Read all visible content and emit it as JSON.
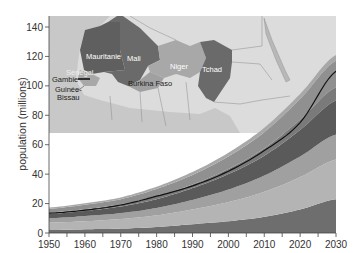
{
  "chart_data": {
    "type": "area",
    "stacked": true,
    "title": "",
    "xlabel": "",
    "ylabel": "population (millions)",
    "xlim": [
      1950,
      2030
    ],
    "ylim": [
      0,
      140
    ],
    "x_ticks": [
      1950,
      1960,
      1970,
      1980,
      1990,
      2000,
      2010,
      2020,
      2030
    ],
    "y_ticks": [
      0,
      20,
      40,
      60,
      80,
      100,
      120,
      140
    ],
    "grid": false,
    "x": [
      1950,
      1960,
      1970,
      1980,
      1990,
      2000,
      2010,
      2020,
      2030
    ],
    "series": [
      {
        "name": "layer-1",
        "color": "#6e6e6e",
        "values": [
          2,
          2.5,
          3,
          4,
          6,
          8,
          11,
          16,
          23
        ]
      },
      {
        "name": "layer-2",
        "color": "#b4b4b4",
        "values": [
          5,
          5.5,
          6.5,
          8,
          10,
          13,
          17,
          22,
          27
        ]
      },
      {
        "name": "layer-3",
        "color": "#a0a0a0",
        "values": [
          3,
          3.5,
          4,
          5,
          6.5,
          8.5,
          11,
          14,
          17
        ]
      },
      {
        "name": "layer-4",
        "color": "#5a5a5a",
        "values": [
          3,
          3.5,
          4.5,
          6,
          8,
          10.5,
          13.5,
          18,
          23
        ]
      },
      {
        "name": "layer-5",
        "color": "#7a7a7a",
        "values": [
          1,
          1.2,
          1.5,
          2,
          2.5,
          3.5,
          5,
          7,
          9
        ]
      },
      {
        "name": "layer-6",
        "color": "#909090",
        "values": [
          2.5,
          3,
          3.5,
          5,
          6.5,
          8.5,
          11,
          14,
          18
        ]
      },
      {
        "name": "layer-7",
        "color": "#a8a8a8",
        "values": [
          0.8,
          1,
          1.2,
          1.5,
          2,
          2.5,
          3,
          3.5,
          4
        ]
      }
    ],
    "highlight_line": {
      "name": "total-line",
      "color": "#111111",
      "values": [
        13.5,
        15.5,
        19,
        25,
        32,
        42,
        56,
        75,
        110
      ]
    },
    "inset_map": {
      "labels": [
        "Mauritanie",
        "Mali",
        "Niger",
        "Tchad",
        "Sénégal",
        "Gambie",
        "Guinée-Bissau",
        "Burkina Faso"
      ]
    }
  },
  "axes": {
    "ylabel": "population (millions)",
    "x_ticks": [
      "1950",
      "1960",
      "1970",
      "1980",
      "1990",
      "2000",
      "2010",
      "2020",
      "2030"
    ],
    "y_ticks": [
      "0",
      "20",
      "40",
      "60",
      "80",
      "100",
      "120",
      "140"
    ]
  },
  "map": {
    "mauritanie": "Mauritanie",
    "mali": "Mali",
    "niger": "Niger",
    "tchad": "Tchad",
    "senegal": "Sénégal",
    "gambie": "Gambie",
    "guinee_line1": "Guinée-",
    "guinee_line2": "Bissau",
    "burkina": "Burkina Faso"
  }
}
